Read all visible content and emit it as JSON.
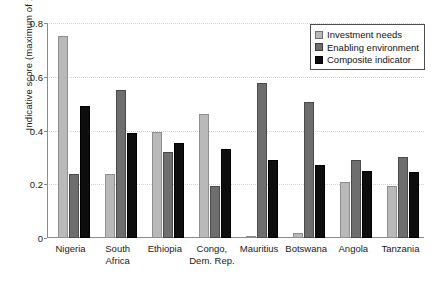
{
  "chart_data": {
    "type": "bar",
    "title": "",
    "xlabel": "",
    "ylabel": "Indicative score (maximum of 1)",
    "ylim": [
      0,
      0.8
    ],
    "yticks": [
      "0",
      "0.2",
      "0.4",
      "0.6",
      "0.8"
    ],
    "ytick_values": [
      0,
      0.2,
      0.4,
      0.6,
      0.8
    ],
    "grid": true,
    "grid_style": "dotted horizontal",
    "legend_position": "top-right",
    "categories": [
      "Nigeria",
      "South Africa",
      "Ethiopia",
      "Congo,\nDem. Rep.",
      "Mauritius",
      "Botswana",
      "Angola",
      "Tanzania"
    ],
    "series": [
      {
        "name": "Investment needs",
        "color": "#b9b9b9",
        "values": [
          0.75,
          0.24,
          0.395,
          0.46,
          0.005,
          0.02,
          0.21,
          0.195
        ]
      },
      {
        "name": "Enabling environment",
        "color": "#6e6e6e",
        "values": [
          0.24,
          0.55,
          0.32,
          0.195,
          0.575,
          0.505,
          0.29,
          0.3
        ]
      },
      {
        "name": "Composite indicator",
        "color": "#0d0d0d",
        "values": [
          0.49,
          0.39,
          0.355,
          0.33,
          0.29,
          0.27,
          0.25,
          0.245
        ]
      }
    ]
  }
}
